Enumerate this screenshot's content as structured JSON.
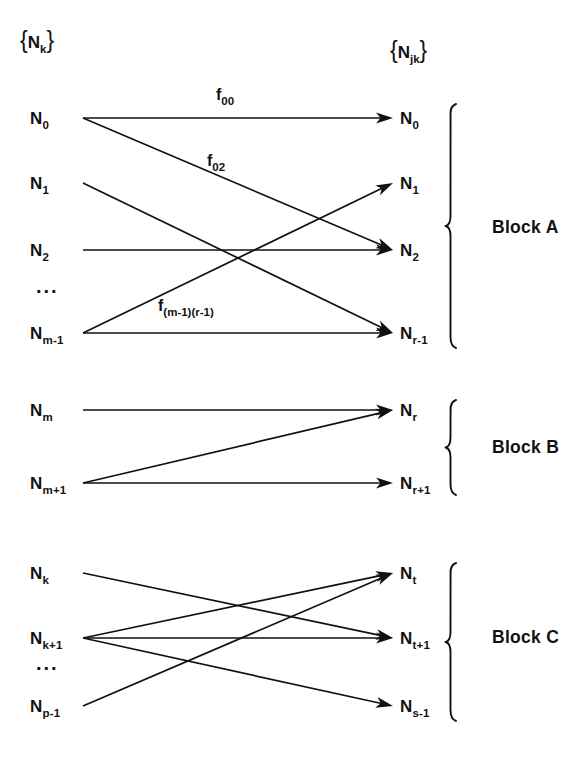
{
  "figure": {
    "stroke_color": "#111111",
    "background_color": "#ffffff"
  },
  "headers": {
    "left": {
      "base": "N",
      "sub": "k",
      "open": "{",
      "close": "}"
    },
    "right": {
      "base": "N",
      "sub": "jk",
      "open": "{",
      "close": "}"
    }
  },
  "ellipsis_text": "...",
  "blocks": [
    {
      "id": "block-a",
      "label": "Block A",
      "brace_top": 104,
      "brace_bottom": 348,
      "label_x": 492,
      "label_y": 233,
      "left_nodes": [
        {
          "id": "a-l0",
          "base": "N",
          "sub": "0",
          "x": 30,
          "y": 118
        },
        {
          "id": "a-l1",
          "base": "N",
          "sub": "1",
          "x": 30,
          "y": 183
        },
        {
          "id": "a-l2",
          "base": "N",
          "sub": "2",
          "x": 30,
          "y": 250
        },
        {
          "id": "a-l3",
          "base": "N",
          "sub": "m-1",
          "x": 30,
          "y": 333
        }
      ],
      "left_ellipsis": {
        "x": 36,
        "y": 293
      },
      "right_nodes": [
        {
          "id": "a-r0",
          "base": "N",
          "sub": "0",
          "x": 400,
          "y": 118
        },
        {
          "id": "a-r1",
          "base": "N",
          "sub": "1",
          "x": 400,
          "y": 183
        },
        {
          "id": "a-r2",
          "base": "N",
          "sub": "2",
          "x": 400,
          "y": 250
        },
        {
          "id": "a-r3",
          "base": "N",
          "sub": "r-1",
          "x": 400,
          "y": 333
        }
      ],
      "edges": [
        {
          "id": "e-a-00",
          "from": "a-l0",
          "to": "a-r0",
          "label": {
            "base": "f",
            "sub": "00",
            "x": 216,
            "y": 100
          }
        },
        {
          "id": "e-a-02",
          "from": "a-l0",
          "to": "a-r2",
          "label": {
            "base": "f",
            "sub": "02",
            "x": 207,
            "y": 166
          }
        },
        {
          "id": "e-a-1r",
          "from": "a-l1",
          "to": "a-r3",
          "label": null
        },
        {
          "id": "e-a-22",
          "from": "a-l2",
          "to": "a-r2",
          "label": null
        },
        {
          "id": "e-a-m1",
          "from": "a-l3",
          "to": "a-r1",
          "label": {
            "base": "f",
            "sub": "(m-1)(r-1)",
            "x": 158,
            "y": 311
          }
        },
        {
          "id": "e-a-mr",
          "from": "a-l3",
          "to": "a-r3",
          "label": null
        }
      ]
    },
    {
      "id": "block-b",
      "label": "Block B",
      "brace_top": 400,
      "brace_bottom": 495,
      "label_x": 492,
      "label_y": 453,
      "left_nodes": [
        {
          "id": "b-l0",
          "base": "N",
          "sub": "m",
          "x": 30,
          "y": 410
        },
        {
          "id": "b-l1",
          "base": "N",
          "sub": "m+1",
          "x": 30,
          "y": 483
        }
      ],
      "left_ellipsis": null,
      "right_nodes": [
        {
          "id": "b-r0",
          "base": "N",
          "sub": "r",
          "x": 400,
          "y": 410
        },
        {
          "id": "b-r1",
          "base": "N",
          "sub": "r+1",
          "x": 400,
          "y": 483
        }
      ],
      "edges": [
        {
          "id": "e-b-mr",
          "from": "b-l0",
          "to": "b-r0",
          "label": null
        },
        {
          "id": "e-b-m1r",
          "from": "b-l1",
          "to": "b-r0",
          "label": null
        },
        {
          "id": "e-b-m1r1",
          "from": "b-l1",
          "to": "b-r1",
          "label": null
        }
      ]
    },
    {
      "id": "block-c",
      "label": "Block C",
      "brace_top": 563,
      "brace_bottom": 721,
      "label_x": 492,
      "label_y": 643,
      "left_nodes": [
        {
          "id": "c-l0",
          "base": "N",
          "sub": "k",
          "x": 30,
          "y": 573
        },
        {
          "id": "c-l1",
          "base": "N",
          "sub": "k+1",
          "x": 30,
          "y": 638
        },
        {
          "id": "c-l2",
          "base": "N",
          "sub": "p-1",
          "x": 30,
          "y": 706
        }
      ],
      "left_ellipsis": {
        "x": 36,
        "y": 670
      },
      "right_nodes": [
        {
          "id": "c-r0",
          "base": "N",
          "sub": "t",
          "x": 400,
          "y": 573
        },
        {
          "id": "c-r1",
          "base": "N",
          "sub": "t+1",
          "x": 400,
          "y": 638
        },
        {
          "id": "c-r2",
          "base": "N",
          "sub": "s-1",
          "x": 400,
          "y": 706
        }
      ],
      "edges": [
        {
          "id": "e-c-kt1",
          "from": "c-l0",
          "to": "c-r1",
          "label": null
        },
        {
          "id": "e-c-k1t",
          "from": "c-l1",
          "to": "c-r0",
          "label": null
        },
        {
          "id": "e-c-k1t1",
          "from": "c-l1",
          "to": "c-r1",
          "label": null
        },
        {
          "id": "e-c-k1s",
          "from": "c-l1",
          "to": "c-r2",
          "label": null
        },
        {
          "id": "e-c-pt",
          "from": "c-l2",
          "to": "c-r0",
          "label": null
        }
      ]
    }
  ]
}
